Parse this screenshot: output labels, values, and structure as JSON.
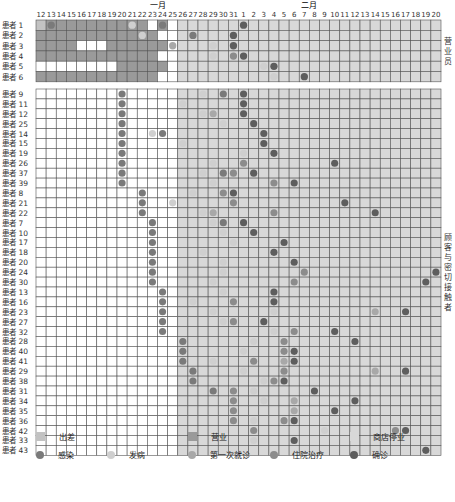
{
  "chart_data": {
    "type": "heatmap",
    "title": "",
    "months": [
      {
        "label": "一月",
        "start_index": 0
      },
      {
        "label": "二月",
        "start_index": 20
      }
    ],
    "days": [
      "12",
      "13",
      "14",
      "15",
      "16",
      "17",
      "18",
      "19",
      "20",
      "21",
      "22",
      "23",
      "24",
      "25",
      "26",
      "27",
      "28",
      "29",
      "30",
      "31",
      "1",
      "2",
      "3",
      "4",
      "5",
      "6",
      "7",
      "8",
      "9",
      "10",
      "11",
      "12",
      "13",
      "14",
      "15",
      "16",
      "17",
      "18",
      "19",
      "20"
    ],
    "shop_closed_from_index": 14,
    "groups": [
      {
        "label": "营业员",
        "rows": [
          {
            "name": "患者 1",
            "cells": "TWWWWWWWWWW_W_",
            "events": [
              [
                1,
                "infect"
              ],
              [
                9,
                "onset"
              ],
              [
                12,
                "infect"
              ],
              [
                20,
                "confirm"
              ]
            ]
          },
          {
            "name": "患者 2",
            "cells": "WWWWWWWWWWWW__",
            "events": [
              [
                10,
                "onset"
              ],
              [
                15,
                "infect"
              ],
              [
                19,
                "confirm"
              ]
            ]
          },
          {
            "name": "患者 3",
            "cells": "WWWW___WWWWWW_",
            "events": [
              [
                13,
                "first_visit"
              ],
              [
                17,
                "onset"
              ],
              [
                19,
                "confirm"
              ]
            ]
          },
          {
            "name": "患者 4",
            "cells": "WWWWWWWWWWWW__",
            "events": [
              [
                17,
                "onset"
              ],
              [
                19,
                "hospital"
              ],
              [
                20,
                "confirm"
              ]
            ]
          },
          {
            "name": "患者 5",
            "cells": "________WWWWW_",
            "events": [
              [
                22,
                "onset"
              ],
              [
                23,
                "confirm"
              ]
            ]
          },
          {
            "name": "患者 6",
            "cells": "WWWWWWWWWWWW__",
            "events": [
              [
                23,
                "onset"
              ],
              [
                26,
                "confirm"
              ]
            ]
          }
        ]
      },
      {
        "label": "顾客与密切接触者",
        "rows": [
          {
            "name": "患者 9",
            "events": [
              [
                8,
                "infect"
              ],
              [
                16,
                "onset"
              ],
              [
                18,
                "infect"
              ],
              [
                20,
                "confirm"
              ]
            ]
          },
          {
            "name": "患者 11",
            "events": [
              [
                8,
                "infect"
              ],
              [
                14,
                "onset"
              ],
              [
                20,
                "confirm"
              ]
            ]
          },
          {
            "name": "患者 12",
            "events": [
              [
                8,
                "infect"
              ],
              [
                16,
                "onset"
              ],
              [
                17,
                "first_visit"
              ],
              [
                20,
                "confirm"
              ]
            ]
          },
          {
            "name": "患者 25",
            "events": [
              [
                8,
                "infect"
              ],
              [
                18,
                "onset"
              ],
              [
                21,
                "confirm"
              ]
            ]
          },
          {
            "name": "患者 14",
            "events": [
              [
                8,
                "infect"
              ],
              [
                11,
                "onset"
              ],
              [
                12,
                "infect"
              ],
              [
                22,
                "confirm"
              ]
            ]
          },
          {
            "name": "患者 15",
            "events": [
              [
                8,
                "infect"
              ],
              [
                14,
                "onset"
              ],
              [
                22,
                "confirm"
              ]
            ]
          },
          {
            "name": "患者 19",
            "events": [
              [
                8,
                "infect"
              ],
              [
                20,
                "onset"
              ],
              [
                23,
                "confirm"
              ]
            ]
          },
          {
            "name": "患者 26",
            "events": [
              [
                8,
                "infect"
              ],
              [
                17,
                "onset"
              ],
              [
                20,
                "hospital"
              ],
              [
                29,
                "confirm"
              ]
            ]
          },
          {
            "name": "患者 37",
            "events": [
              [
                8,
                "infect"
              ],
              [
                16,
                "onset"
              ],
              [
                18,
                "infect"
              ],
              [
                19,
                "hospital"
              ],
              [
                21,
                "confirm"
              ]
            ]
          },
          {
            "name": "患者 39",
            "events": [
              [
                8,
                "infect"
              ],
              [
                17,
                "onset"
              ],
              [
                23,
                "hospital"
              ],
              [
                25,
                "confirm"
              ]
            ]
          },
          {
            "name": "患者 8",
            "events": [
              [
                10,
                "infect"
              ],
              [
                15,
                "onset"
              ],
              [
                18,
                "hospital"
              ],
              [
                19,
                "confirm"
              ]
            ]
          },
          {
            "name": "患者 21",
            "events": [
              [
                10,
                "infect"
              ],
              [
                13,
                "onset"
              ],
              [
                19,
                "hospital"
              ],
              [
                30,
                "confirm"
              ]
            ]
          },
          {
            "name": "患者 22",
            "events": [
              [
                10,
                "infect"
              ],
              [
                16,
                "onset"
              ],
              [
                17,
                "first_visit"
              ],
              [
                23,
                "hospital"
              ],
              [
                33,
                "confirm"
              ]
            ]
          },
          {
            "name": "患者 7",
            "events": [
              [
                11,
                "infect"
              ],
              [
                17,
                "onset"
              ],
              [
                18,
                "infect"
              ],
              [
                20,
                "confirm"
              ]
            ]
          },
          {
            "name": "患者 10",
            "events": [
              [
                11,
                "infect"
              ],
              [
                18,
                "onset"
              ],
              [
                21,
                "confirm"
              ]
            ]
          },
          {
            "name": "患者 17",
            "events": [
              [
                11,
                "infect"
              ],
              [
                19,
                "onset"
              ],
              [
                24,
                "confirm"
              ]
            ]
          },
          {
            "name": "患者 18",
            "events": [
              [
                11,
                "infect"
              ],
              [
                16,
                "onset"
              ],
              [
                23,
                "confirm"
              ]
            ]
          },
          {
            "name": "患者 20",
            "events": [
              [
                11,
                "infect"
              ],
              [
                18,
                "onset"
              ],
              [
                25,
                "confirm"
              ]
            ]
          },
          {
            "name": "患者 24",
            "events": [
              [
                11,
                "infect"
              ],
              [
                18,
                "onset"
              ],
              [
                26,
                "hospital"
              ],
              [
                39,
                "confirm"
              ]
            ]
          },
          {
            "name": "患者 30",
            "events": [
              [
                11,
                "infect"
              ],
              [
                17,
                "onset"
              ],
              [
                25,
                "hospital"
              ],
              [
                38,
                "confirm"
              ]
            ]
          },
          {
            "name": "患者 13",
            "events": [
              [
                12,
                "infect"
              ],
              [
                18,
                "onset"
              ],
              [
                23,
                "confirm"
              ]
            ]
          },
          {
            "name": "患者 16",
            "events": [
              [
                12,
                "infect"
              ],
              [
                15,
                "onset"
              ],
              [
                19,
                "hospital"
              ],
              [
                23,
                "confirm"
              ]
            ]
          },
          {
            "name": "患者 23",
            "events": [
              [
                12,
                "infect"
              ],
              [
                17,
                "onset"
              ],
              [
                23,
                "onset"
              ],
              [
                33,
                "first_visit"
              ],
              [
                36,
                "confirm"
              ]
            ]
          },
          {
            "name": "患者 27",
            "events": [
              [
                12,
                "infect"
              ],
              [
                18,
                "onset"
              ],
              [
                19,
                "hospital"
              ],
              [
                22,
                "confirm"
              ]
            ]
          },
          {
            "name": "患者 32",
            "events": [
              [
                12,
                "infect"
              ],
              [
                23,
                "onset"
              ],
              [
                25,
                "hospital"
              ],
              [
                29,
                "confirm"
              ]
            ]
          },
          {
            "name": "患者 28",
            "events": [
              [
                14,
                "infect"
              ],
              [
                21,
                "onset"
              ],
              [
                24,
                "hospital"
              ],
              [
                31,
                "confirm"
              ]
            ]
          },
          {
            "name": "患者 40",
            "events": [
              [
                14,
                "infect"
              ],
              [
                20,
                "onset"
              ],
              [
                24,
                "hospital"
              ],
              [
                25,
                "confirm"
              ]
            ]
          },
          {
            "name": "患者 41",
            "events": [
              [
                14,
                "infect"
              ],
              [
                17,
                "onset"
              ],
              [
                21,
                "hospital"
              ],
              [
                24,
                "first_visit"
              ],
              [
                25,
                "confirm"
              ]
            ]
          },
          {
            "name": "患者 29",
            "events": [
              [
                15,
                "infect"
              ],
              [
                20,
                "onset"
              ],
              [
                24,
                "hospital"
              ],
              [
                33,
                "first_visit"
              ],
              [
                36,
                "confirm"
              ]
            ]
          },
          {
            "name": "患者 38",
            "events": [
              [
                15,
                "infect"
              ],
              [
                22,
                "onset"
              ],
              [
                23,
                "hospital"
              ],
              [
                24,
                "confirm"
              ]
            ]
          },
          {
            "name": "患者 31",
            "events": [
              [
                17,
                "infect"
              ],
              [
                19,
                "hospital"
              ],
              [
                21,
                "onset"
              ],
              [
                27,
                "confirm"
              ]
            ]
          },
          {
            "name": "患者 34",
            "events": [
              [
                19,
                "hospital"
              ],
              [
                22,
                "onset"
              ],
              [
                25,
                "first_visit"
              ],
              [
                31,
                "confirm"
              ]
            ]
          },
          {
            "name": "患者 35",
            "events": [
              [
                19,
                "hospital"
              ],
              [
                25,
                "first_visit"
              ],
              [
                29,
                "confirm"
              ]
            ]
          },
          {
            "name": "患者 36",
            "events": [
              [
                19,
                "hospital"
              ],
              [
                21,
                "onset"
              ],
              [
                24,
                "hospital"
              ],
              [
                25,
                "confirm"
              ]
            ]
          },
          {
            "name": "患者 42",
            "events": [
              [
                21,
                "hospital"
              ],
              [
                28,
                "onset"
              ],
              [
                35,
                "hospital"
              ],
              [
                36,
                "confirm"
              ]
            ]
          },
          {
            "name": "患者 33",
            "events": [
              [
                21,
                "onset"
              ],
              [
                25,
                "confirm"
              ]
            ]
          },
          {
            "name": "患者 43",
            "events": [
              [
                38,
                "confirm"
              ]
            ]
          }
        ]
      }
    ],
    "legend": [
      {
        "key": "T",
        "label": "出差",
        "kind": "square",
        "color": "#c2c2c2"
      },
      {
        "key": "W",
        "label": "营业",
        "kind": "square",
        "color": "#9a9a9a"
      },
      {
        "key": "S",
        "label": "商店停业",
        "kind": "square",
        "color": "#d8d8d8"
      },
      {
        "key": "infect",
        "label": "感染",
        "kind": "dot",
        "color": "#7a7a7a"
      },
      {
        "key": "onset",
        "label": "发病",
        "kind": "dot",
        "color": "#cfcfcf"
      },
      {
        "key": "first_visit",
        "label": "第一次就诊",
        "kind": "dot",
        "color": "#a8a8a8"
      },
      {
        "key": "hospital",
        "label": "住院治疗",
        "kind": "dot",
        "color": "#8c8c8c"
      },
      {
        "key": "confirm",
        "label": "确诊",
        "kind": "dot",
        "color": "#5e5e5e"
      }
    ]
  },
  "colors": {
    "grid_line": "#555555",
    "empty": "#ffffff"
  }
}
